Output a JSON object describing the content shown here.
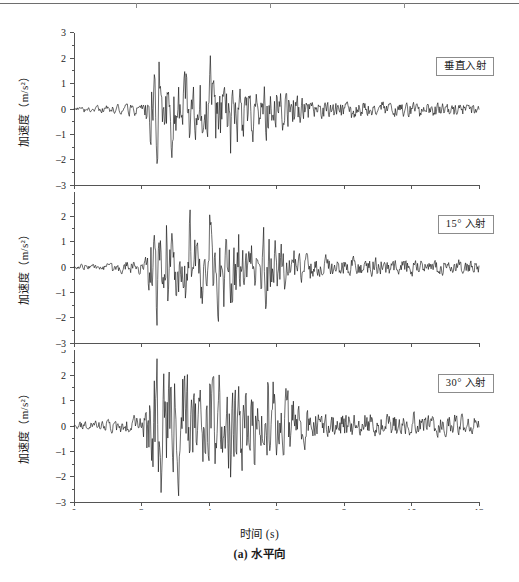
{
  "page": {
    "top_rule_ticks": [
      136,
      270,
      404
    ]
  },
  "figure": {
    "caption": "(a) 水平向",
    "x_axis_title": "时间 (s)",
    "y_axis_title_text": "加速度",
    "y_axis_title_unit": "（m/s²）",
    "axis_color": "#555555",
    "wave_color": "#111111",
    "legend_border_color": "#8c8c8c"
  },
  "chart_data": [
    {
      "type": "line",
      "panel_index": 0,
      "title": "",
      "legend": "垂直入射",
      "xlabel": "时间 (s)",
      "ylabel": "加速度（m/s²）",
      "xlim": [
        0,
        12
      ],
      "ylim": [
        -3,
        3
      ],
      "xticks": [
        0,
        2,
        4,
        6,
        8,
        10,
        12
      ],
      "yticks": [
        -3,
        -2,
        -1,
        0,
        1,
        2,
        3
      ],
      "xtick_labels": [
        "0",
        "2",
        "4",
        "6",
        "8",
        "10",
        "12"
      ],
      "ytick_labels": [
        "-3",
        "-2",
        "-1",
        "0",
        "1",
        "2",
        "3"
      ],
      "grid": false,
      "legend_position": "top-right",
      "seed": 20731,
      "peak_positive": 2.1,
      "peak_negative": -2.15,
      "envelope": {
        "quiet_start_level": 0.35,
        "onset_time": 2.1,
        "strong_start": 2.2,
        "strong_end": 5.6,
        "strong_level": 1.95,
        "decay_time": 7.2,
        "tail_level": 0.5,
        "end_level": 0.38
      },
      "sample_dt": 0.02,
      "description": "Horizontal ground acceleration time history, vertical incidence"
    },
    {
      "type": "line",
      "panel_index": 1,
      "title": "",
      "legend": "15° 入射",
      "xlabel": "时间 (s)",
      "ylabel": "加速度（m/s²）",
      "xlim": [
        0,
        12
      ],
      "ylim": [
        -3,
        3
      ],
      "xticks": [
        0,
        2,
        4,
        6,
        8,
        10,
        12
      ],
      "yticks": [
        -3,
        -2,
        -1,
        0,
        1,
        2,
        3
      ],
      "xtick_labels": [
        "0",
        "2",
        "4",
        "6",
        "8",
        "10",
        "12"
      ],
      "ytick_labels": [
        "-3",
        "-2",
        "-1",
        "0",
        "1",
        "2",
        "3"
      ],
      "grid": false,
      "legend_position": "top-right",
      "seed": 51194,
      "peak_positive": 2.25,
      "peak_negative": -2.3,
      "envelope": {
        "quiet_start_level": 0.35,
        "onset_time": 2.1,
        "strong_start": 2.2,
        "strong_end": 5.6,
        "strong_level": 2.05,
        "decay_time": 7.2,
        "tail_level": 0.52,
        "end_level": 0.4
      },
      "sample_dt": 0.02,
      "description": "Horizontal ground acceleration time history, 15 degree incidence"
    },
    {
      "type": "line",
      "panel_index": 2,
      "title": "",
      "legend": "30° 入射",
      "xlabel": "时间 (s)",
      "ylabel": "加速度（m/s²）",
      "xlim": [
        0,
        12
      ],
      "ylim": [
        -3,
        3
      ],
      "xticks": [
        0,
        2,
        4,
        6,
        8,
        10,
        12
      ],
      "yticks": [
        -3,
        -2,
        -1,
        0,
        1,
        2,
        3
      ],
      "xtick_labels": [
        "0",
        "2",
        "4",
        "6",
        "8",
        "10",
        "12"
      ],
      "ytick_labels": [
        "-3",
        "-2",
        "-1",
        "0",
        "1",
        "2",
        "3"
      ],
      "grid": false,
      "legend_position": "top-right",
      "seed": 88342,
      "peak_positive": 2.65,
      "peak_negative": -2.75,
      "envelope": {
        "quiet_start_level": 0.38,
        "onset_time": 2.05,
        "strong_start": 2.15,
        "strong_end": 5.7,
        "strong_level": 2.35,
        "decay_time": 7.3,
        "tail_level": 0.58,
        "end_level": 0.44
      },
      "sample_dt": 0.02,
      "description": "Horizontal ground acceleration time history, 30 degree incidence"
    }
  ],
  "panels_geometry": [
    {
      "top": 20,
      "height": 172,
      "plot_left": 74,
      "plot_right": 479,
      "y_zero": 109,
      "y_unit_px": 25.4
    },
    {
      "top": 192,
      "height": 158,
      "plot_left": 74,
      "plot_right": 479,
      "y_zero": 267,
      "y_unit_px": 25.4
    },
    {
      "top": 350,
      "height": 160,
      "plot_left": 74,
      "plot_right": 479,
      "y_zero": 426,
      "y_unit_px": 25.4
    }
  ]
}
